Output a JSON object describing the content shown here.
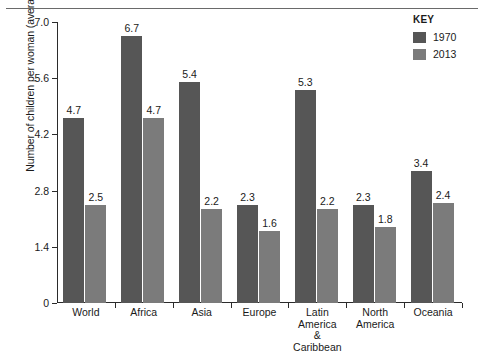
{
  "chart_data": {
    "type": "bar",
    "title": "",
    "xlabel": "",
    "ylabel": "Number of children per woman (average)",
    "ylim": [
      0,
      7.0
    ],
    "yticks": [
      "0",
      "1.4",
      "2.8",
      "4.2",
      "5.6",
      "7.0"
    ],
    "ytick_values": [
      0,
      1.4,
      2.8,
      4.2,
      5.6,
      7.0
    ],
    "grid": false,
    "legend_position": "top-right",
    "legend_title": "KEY",
    "categories": [
      "World",
      "Africa",
      "Asia",
      "Europe",
      "Latin America\n& Caribbean",
      "North\nAmerica",
      "Oceania"
    ],
    "series": [
      {
        "name": "1970",
        "color": "#565656",
        "values": [
          4.7,
          6.7,
          5.4,
          2.3,
          5.3,
          2.3,
          3.4
        ],
        "labels": [
          "4.7",
          "6.7",
          "5.4",
          "2.3",
          "5.3",
          "2.3",
          "3.4"
        ],
        "drawn_heights": [
          4.6,
          6.65,
          5.5,
          2.45,
          5.3,
          2.45,
          3.3
        ]
      },
      {
        "name": "2013",
        "color": "#7b7b7b",
        "values": [
          2.5,
          4.7,
          2.2,
          1.6,
          2.2,
          1.8,
          2.4
        ],
        "labels": [
          "2.5",
          "4.7",
          "2.2",
          "1.6",
          "2.2",
          "1.8",
          "2.4"
        ],
        "drawn_heights": [
          2.45,
          4.6,
          2.35,
          1.8,
          2.35,
          1.9,
          2.5
        ]
      }
    ]
  }
}
